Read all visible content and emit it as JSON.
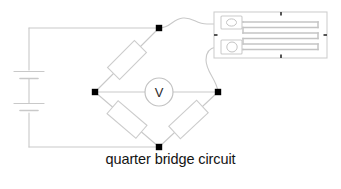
{
  "figure": {
    "caption": "quarter bridge circuit",
    "background_color": "#ffffff"
  },
  "circuit": {
    "title": "quarter bridge circuit",
    "wire_color": "#c9c9c9",
    "node_color": "#000000",
    "meter": {
      "name": "voltmeter",
      "label": "V",
      "shape": "circle"
    },
    "source": {
      "name": "battery",
      "symbol": "multi-cell-battery",
      "cells": 2
    },
    "arms": [
      {
        "name": "resistor-top-left",
        "label": ""
      },
      {
        "name": "resistor-bottom-left",
        "label": ""
      },
      {
        "name": "resistor-bottom-right",
        "label": ""
      },
      {
        "name": "strain-gauge-top-right",
        "label": ""
      }
    ],
    "nodes": [
      {
        "name": "node-top",
        "x": 159,
        "y": 28
      },
      {
        "name": "node-left",
        "x": 95,
        "y": 92
      },
      {
        "name": "node-right",
        "x": 218,
        "y": 92
      },
      {
        "name": "node-bottom",
        "x": 159,
        "y": 147
      }
    ]
  },
  "strain_gauge": {
    "name": "strain-gauge",
    "backing_color": "#cfcfcf",
    "grid_color": "#c4c4c4",
    "grid_traces": 6,
    "solder_tabs": 2,
    "alignment_marks": 4
  }
}
